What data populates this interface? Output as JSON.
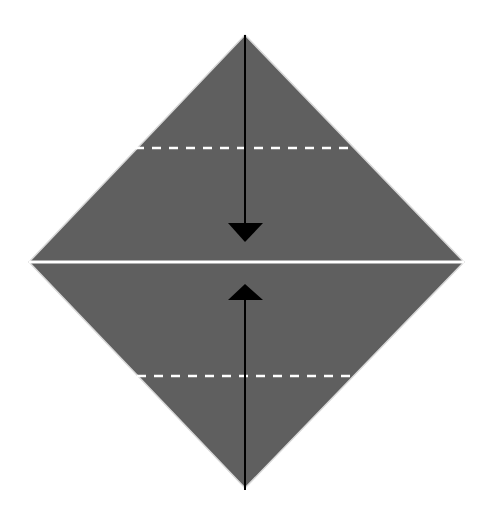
{
  "diagram": {
    "type": "origami-fold-step",
    "colors": {
      "paper": "#5f5f5f",
      "edge": "#d8d8d8",
      "crease": "#ffffff",
      "arrow": "#000000",
      "background": "#ffffff"
    },
    "square": {
      "top": [
        245,
        35
      ],
      "right": [
        464,
        262
      ],
      "bottom": [
        245,
        488
      ],
      "left": [
        29,
        262
      ]
    },
    "center_line_y": 262,
    "dashed_folds": [
      {
        "name": "upper-valley-fold",
        "y": 148,
        "x1": 135,
        "x2": 350
      },
      {
        "name": "lower-valley-fold",
        "y": 376,
        "x1": 137,
        "x2": 350
      }
    ],
    "arrows": [
      {
        "name": "fold-down-arrow",
        "from": [
          245,
          35
        ],
        "to": [
          245,
          242
        ],
        "direction": "down"
      },
      {
        "name": "fold-up-arrow",
        "from": [
          245,
          490
        ],
        "to": [
          245,
          284
        ],
        "direction": "up"
      }
    ]
  }
}
